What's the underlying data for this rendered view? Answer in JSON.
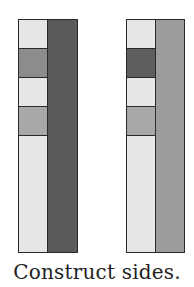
{
  "caption": "Construct sides.",
  "figures": [
    {
      "name": "left-bar",
      "left_column_cells": [
        {
          "shade": "light",
          "color": "#e6e6e6",
          "height": 29
        },
        {
          "shade": "medium-dark",
          "color": "#8c8c8c",
          "height": 29
        },
        {
          "shade": "light",
          "color": "#e6e6e6",
          "height": 29
        },
        {
          "shade": "medium",
          "color": "#a8a8a8",
          "height": 29
        },
        {
          "shade": "light",
          "color": "#e6e6e6",
          "height": 116
        }
      ],
      "right_column": {
        "shade": "dark",
        "color": "#5a5a5a"
      }
    },
    {
      "name": "right-bar",
      "left_column_cells": [
        {
          "shade": "light",
          "color": "#e6e6e6",
          "height": 29
        },
        {
          "shade": "dark",
          "color": "#5e5e5e",
          "height": 29
        },
        {
          "shade": "light",
          "color": "#e6e6e6",
          "height": 29
        },
        {
          "shade": "medium",
          "color": "#a8a8a8",
          "height": 29
        },
        {
          "shade": "light",
          "color": "#e6e6e6",
          "height": 116
        }
      ],
      "right_column": {
        "shade": "medium",
        "color": "#9c9c9c"
      }
    }
  ]
}
